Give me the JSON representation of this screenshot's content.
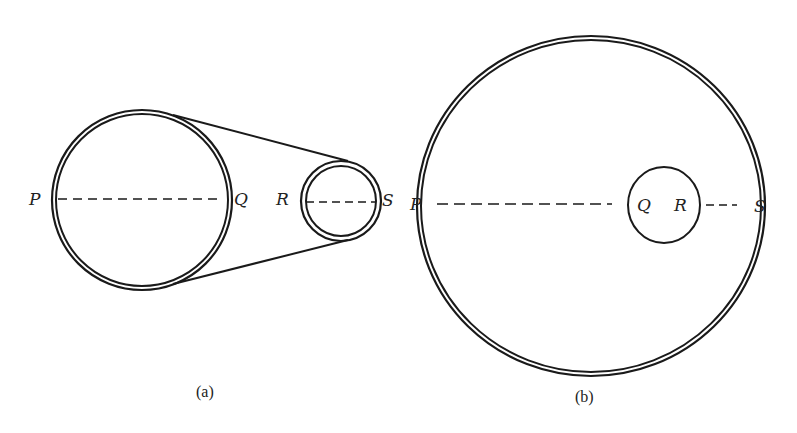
{
  "figure_a": {
    "caption": "(a)",
    "labels": {
      "P": "P",
      "Q": "Q",
      "R": "R",
      "S": "S"
    },
    "large_pulley": {
      "cx": 142,
      "cy": 200,
      "r_outer": 90,
      "r_inner": 86
    },
    "small_pulley": {
      "cx": 341,
      "cy": 201,
      "r_outer": 40,
      "r_inner": 35
    }
  },
  "figure_b": {
    "caption": "(b)",
    "labels": {
      "P": "P",
      "Q": "Q",
      "R": "R",
      "S": "S"
    },
    "outer_ring": {
      "cx": 591,
      "cy": 205,
      "r_outer": 174,
      "r_inner": 170
    },
    "inner_wheel": {
      "cx": 663,
      "cy": 205,
      "r": 38
    }
  },
  "colors": {
    "stroke": "#1a1a1a",
    "background": "#ffffff"
  }
}
